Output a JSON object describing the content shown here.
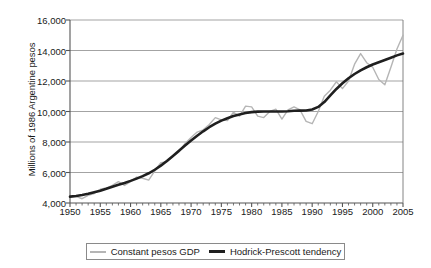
{
  "chart_data": {
    "type": "line",
    "title": "",
    "xlabel": "",
    "ylabel": "Millions of 1986 Argentine pesos",
    "xlim": [
      1950,
      2005
    ],
    "ylim": [
      4000,
      16000
    ],
    "yticks": [
      "4,000",
      "6,000",
      "8,000",
      "10,000",
      "12,000",
      "14,000",
      "16,000"
    ],
    "ytick_values": [
      4000,
      6000,
      8000,
      10000,
      12000,
      14000,
      16000
    ],
    "xticks": [
      "1950",
      "1955",
      "1960",
      "1965",
      "1970",
      "1975",
      "1980",
      "1985",
      "1990",
      "1995",
      "2000",
      "2005"
    ],
    "xtick_values": [
      1950,
      1955,
      1960,
      1965,
      1970,
      1975,
      1980,
      1985,
      1990,
      1995,
      2000,
      2005
    ],
    "minor_xtick_step": 1,
    "grid": "horizontal",
    "legend_position": "bottom-center",
    "x": [
      1950,
      1951,
      1952,
      1953,
      1954,
      1955,
      1956,
      1957,
      1958,
      1959,
      1960,
      1961,
      1962,
      1963,
      1964,
      1965,
      1966,
      1967,
      1968,
      1969,
      1970,
      1971,
      1972,
      1973,
      1974,
      1975,
      1976,
      1977,
      1978,
      1979,
      1980,
      1981,
      1982,
      1983,
      1984,
      1985,
      1986,
      1987,
      1988,
      1989,
      1990,
      1991,
      1992,
      1993,
      1994,
      1995,
      1996,
      1997,
      1998,
      1999,
      2000,
      2001,
      2002,
      2003,
      2004,
      2005
    ],
    "series": [
      {
        "name": "Constant pesos GDP",
        "color": "#b5b5b5",
        "width": 1.4,
        "values": [
          4400,
          4430,
          4280,
          4500,
          4620,
          4900,
          4980,
          5150,
          5400,
          5150,
          5400,
          5700,
          5620,
          5500,
          6100,
          6650,
          6700,
          7050,
          7350,
          7900,
          8300,
          8650,
          8800,
          9150,
          9600,
          9450,
          9400,
          9950,
          9700,
          10350,
          10300,
          9700,
          9600,
          10000,
          10150,
          9500,
          10100,
          10300,
          10100,
          9350,
          9200,
          10000,
          11000,
          11400,
          11950,
          11500,
          12000,
          13100,
          13800,
          13200,
          12900,
          12100,
          11750,
          12900,
          14100,
          15000
        ]
      },
      {
        "name": "Hodrick-Prescott tendency",
        "color": "#1f1f1f",
        "width": 2.6,
        "values": [
          4420,
          4460,
          4520,
          4600,
          4700,
          4810,
          4930,
          5060,
          5190,
          5310,
          5450,
          5600,
          5760,
          5950,
          6180,
          6450,
          6760,
          7090,
          7430,
          7770,
          8100,
          8410,
          8700,
          8970,
          9200,
          9400,
          9560,
          9700,
          9810,
          9900,
          9960,
          9990,
          10000,
          10000,
          10000,
          10000,
          10020,
          10050,
          10060,
          10070,
          10130,
          10300,
          10620,
          11050,
          11480,
          11850,
          12180,
          12460,
          12700,
          12900,
          13080,
          13230,
          13380,
          13530,
          13680,
          13800
        ]
      }
    ]
  },
  "legend": {
    "items": [
      {
        "label": "Constant pesos GDP"
      },
      {
        "label": "Hodrick-Prescott tendency"
      }
    ]
  }
}
